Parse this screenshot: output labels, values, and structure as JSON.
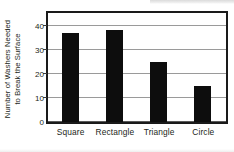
{
  "chart_data": {
    "type": "bar",
    "title": "",
    "subtitle": "",
    "xlabel": "",
    "ylabel": "Number of  Washers Needed to Break the Surface",
    "ylabel_lines": [
      "Number of  Washers Needed",
      "to Break the Surface"
    ],
    "categories": [
      "Square",
      "Rectangle",
      "Triangle",
      "Circle"
    ],
    "values": [
      37,
      38.5,
      25,
      15
    ],
    "ylim": [
      0,
      45
    ],
    "yticks": [
      0,
      10,
      20,
      30,
      40
    ],
    "ytick_labels": [
      "0",
      "10",
      "20",
      "30",
      "40"
    ],
    "grid": true,
    "grid_axis": "y",
    "legend": false,
    "legend_position": "none",
    "bar_color": "#0d0d0d",
    "grid_color": "#9a9a9a",
    "frame_color": "#1a1a1a",
    "text_color": "#231f20",
    "background": "#ffffff"
  }
}
